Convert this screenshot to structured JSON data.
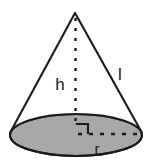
{
  "figure": {
    "name": "cone-geometry-diagram",
    "shape": "cone",
    "background_color": "#ffffff",
    "stroke_color": "#1a1a1a",
    "base_fill_color": "#a8a8a8",
    "labels": {
      "height": "h",
      "slant": "l",
      "radius": "r"
    },
    "geometry": {
      "apex_x": 75,
      "apex_y": 13,
      "base_center_x": 76,
      "base_center_y": 135,
      "base_rx": 66,
      "base_ry": 21,
      "height_line_top_y": 18,
      "height_line_bottom_y": 128,
      "radius_line_start_x": 76,
      "radius_line_end_x": 140,
      "radius_line_y": 134,
      "right_angle_size": 12
    },
    "label_positions": {
      "height_x": 60,
      "height_y": 90,
      "slant_x": 118,
      "slant_y": 80,
      "radius_x": 90,
      "radius_y": 155
    }
  }
}
